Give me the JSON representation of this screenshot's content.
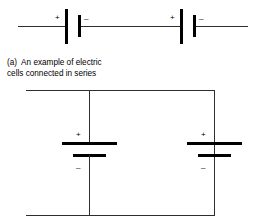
{
  "figure": {
    "background_color": "#ffffff",
    "wire_color": "#2e2e2e",
    "plate_color": "#000000",
    "label_color": "#000000"
  },
  "series_circuit": {
    "name": "series circuit",
    "cells": [
      {
        "plus_label": "+",
        "minus_label": "–"
      },
      {
        "plus_label": "+",
        "minus_label": "–"
      }
    ]
  },
  "caption": {
    "line1": "(a)  An example of electric",
    "line2": "cells connected in series"
  },
  "parallel_circuit": {
    "name": "parallel circuit",
    "cells": [
      {
        "plus_label": "+",
        "minus_label": "–"
      },
      {
        "plus_label": "+",
        "minus_label": "–"
      }
    ]
  }
}
